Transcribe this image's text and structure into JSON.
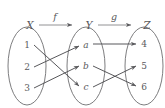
{
  "figure": {
    "background_color": "#ffffff",
    "stroke_color": "#6e6e70",
    "text_color": "#58585b"
  },
  "sets": [
    {
      "name": "X",
      "label": "X",
      "elements": [
        {
          "id": "1",
          "label": "1"
        },
        {
          "id": "2",
          "label": "2"
        },
        {
          "id": "3",
          "label": "3"
        }
      ]
    },
    {
      "name": "Y",
      "label": "Y",
      "elements": [
        {
          "id": "a",
          "label": "a"
        },
        {
          "id": "b",
          "label": "b"
        },
        {
          "id": "c",
          "label": "c"
        }
      ]
    },
    {
      "name": "Z",
      "label": "Z",
      "elements": [
        {
          "id": "4",
          "label": "4"
        },
        {
          "id": "5",
          "label": "5"
        },
        {
          "id": "6",
          "label": "6"
        }
      ]
    }
  ],
  "functions": [
    {
      "name": "f",
      "label": "f",
      "from": "X",
      "to": "Y"
    },
    {
      "name": "g",
      "label": "g",
      "from": "Y",
      "to": "Z"
    }
  ],
  "mappings": {
    "f": [
      {
        "from": "1",
        "to": "c"
      },
      {
        "from": "2",
        "to": "a"
      },
      {
        "from": "3",
        "to": "b"
      }
    ],
    "g": [
      {
        "from": "a",
        "to": "4"
      },
      {
        "from": "b",
        "to": "6"
      },
      {
        "from": "c",
        "to": "5"
      }
    ]
  }
}
